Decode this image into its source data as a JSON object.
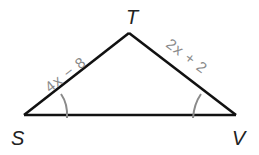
{
  "figure": {
    "type": "triangle",
    "vertices": {
      "S": {
        "label": "S",
        "x": 24,
        "y": 115
      },
      "T": {
        "label": "T",
        "x": 129,
        "y": 33
      },
      "V": {
        "label": "V",
        "x": 236,
        "y": 115
      }
    },
    "sides": {
      "ST": {
        "label": "4x − 8"
      },
      "TV": {
        "label": "2x + 2"
      },
      "SV": {
        "label": ""
      }
    },
    "angle_marks": {
      "S": {
        "count": 1,
        "note": "congruent to angle V"
      },
      "V": {
        "count": 1,
        "note": "congruent to angle S"
      }
    }
  },
  "colors": {
    "edge": "#111111",
    "label_gray": "#8a8a8a",
    "vertex_label": "#222222",
    "background": "#ffffff"
  }
}
